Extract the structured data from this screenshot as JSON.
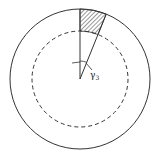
{
  "diagram": {
    "type": "annular sector schematic",
    "center": [
      80,
      79
    ],
    "outer_circle": {
      "radius": 70,
      "style": "solid",
      "color": "#333333"
    },
    "inner_circle": {
      "radius": 48,
      "style": "dashed",
      "color": "#333333"
    },
    "radial_lines": [
      {
        "angle_deg_from_vertical": 0
      },
      {
        "angle_deg_from_vertical": 22
      }
    ],
    "hatched_region": {
      "from_radius": 48,
      "to_radius": 70,
      "angle_start": 0,
      "angle_end": 22,
      "pattern": "diagonal hatch"
    },
    "angle_label": {
      "symbol": "γ",
      "subscript": "3"
    }
  }
}
